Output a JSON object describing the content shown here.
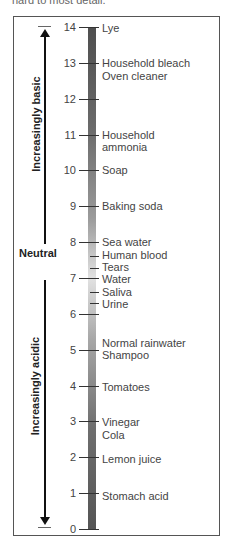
{
  "top_text_fragment": "hard to most detail.",
  "scale": {
    "min": 0,
    "max": 14,
    "ticks": [
      "0",
      "1",
      "2",
      "3",
      "4",
      "5",
      "6",
      "7",
      "8",
      "9",
      "10",
      "11",
      "12",
      "13",
      "14"
    ]
  },
  "axis_labels": {
    "basic": "Increasingly basic",
    "neutral": "Neutral",
    "acidic": "Increasingly acidic"
  },
  "items": [
    {
      "label": "Lye",
      "ph": 14
    },
    {
      "label": "Household bleach",
      "ph": 13
    },
    {
      "label": "Oven cleaner",
      "ph": 12.6
    },
    {
      "label": "Household",
      "ph": 11
    },
    {
      "label": "ammonia",
      "ph": 11
    },
    {
      "label": "Soap",
      "ph": 10
    },
    {
      "label": "Baking soda",
      "ph": 9
    },
    {
      "label": "Sea water",
      "ph": 8
    },
    {
      "label": "Human blood",
      "ph": 7.6
    },
    {
      "label": "Tears",
      "ph": 7.3
    },
    {
      "label": "Water",
      "ph": 7
    },
    {
      "label": "Saliva",
      "ph": 6.7
    },
    {
      "label": "Urine",
      "ph": 6.4
    },
    {
      "label": "Normal rainwater",
      "ph": 5.4
    },
    {
      "label": "Shampoo",
      "ph": 5
    },
    {
      "label": "Tomatoes",
      "ph": 4
    },
    {
      "label": "Vinegar",
      "ph": 3
    },
    {
      "label": "Cola",
      "ph": 2.6
    },
    {
      "label": "Lemon juice",
      "ph": 2
    },
    {
      "label": "Stomach acid",
      "ph": 1
    }
  ],
  "chart_data": {
    "type": "scale",
    "axis": {
      "min": 0,
      "max": 14,
      "step": 1
    },
    "annotations": [
      {
        "text": "Increasingly basic",
        "direction": "up",
        "range": [
          7,
          14
        ]
      },
      {
        "text": "Neutral",
        "at": 7
      },
      {
        "text": "Increasingly acidic",
        "direction": "down",
        "range": [
          0,
          7
        ]
      }
    ],
    "points": [
      {
        "label": "Lye",
        "ph": 14
      },
      {
        "label": "Household bleach",
        "ph": 13
      },
      {
        "label": "Oven cleaner",
        "ph": 13
      },
      {
        "label": "Household ammonia",
        "ph": 11
      },
      {
        "label": "Soap",
        "ph": 10
      },
      {
        "label": "Baking soda",
        "ph": 9
      },
      {
        "label": "Sea water",
        "ph": 8
      },
      {
        "label": "Human blood",
        "ph": 7.5
      },
      {
        "label": "Tears",
        "ph": 7.2
      },
      {
        "label": "Water",
        "ph": 7
      },
      {
        "label": "Saliva",
        "ph": 6.7
      },
      {
        "label": "Urine",
        "ph": 6.3
      },
      {
        "label": "Normal rainwater",
        "ph": 5.4
      },
      {
        "label": "Shampoo",
        "ph": 5
      },
      {
        "label": "Tomatoes",
        "ph": 4
      },
      {
        "label": "Vinegar",
        "ph": 3
      },
      {
        "label": "Cola",
        "ph": 2.6
      },
      {
        "label": "Lemon juice",
        "ph": 2
      },
      {
        "label": "Stomach acid",
        "ph": 1
      }
    ]
  }
}
